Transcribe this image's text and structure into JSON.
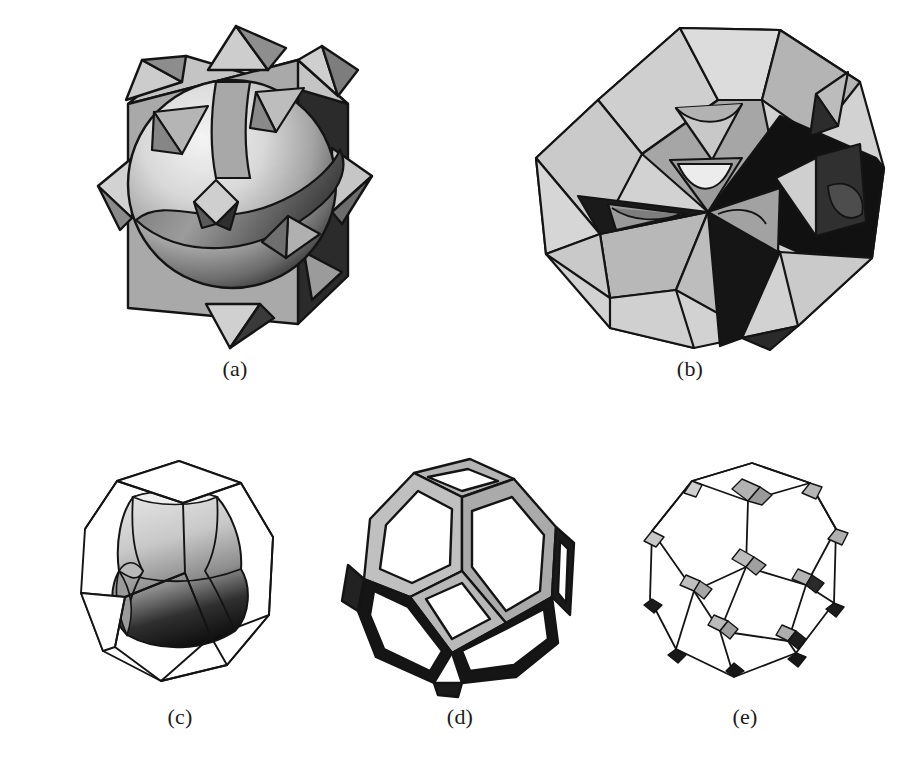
{
  "figure": {
    "domain": "Paper",
    "background_color": "#ffffff",
    "row_layout": [
      2,
      3
    ],
    "palette": {
      "white": "#ffffff",
      "near_white": "#f2f2f2",
      "light_gray": "#d9d9d9",
      "mid_light_gray": "#c2c2c2",
      "mid_gray": "#a8a8a8",
      "dark_gray": "#6b6b6b",
      "very_dark_gray": "#2e2e2e",
      "black": "#111111",
      "outline": "#141414"
    }
  },
  "panels": [
    {
      "id": "a",
      "label": "(a)",
      "caption_label": "(a)",
      "subject": "sphere intersecting a cube with octahedral spikes",
      "shading": "radial gradient sphere, flat shaded cube faces, dark right face",
      "face_tones": {
        "front": "#a8a8a8",
        "top": "#c2c2c2",
        "right_shadow": "#2e2e2e",
        "sphere_highlight": "#f0f0f0",
        "sphere_shadow": "#4a4a4a"
      }
    },
    {
      "id": "b",
      "label": "(b)",
      "caption_label": "(b)",
      "subject": "complex faceted polyhedron with interpenetrating planes and dark interior wedges",
      "shading": "multi-tone flat facets with light, mid and black regions",
      "face_tones": {
        "light": "#d4d4d4",
        "mid": "#a6a6a6",
        "dark": "#111111",
        "accent": "#6b6b6b"
      }
    },
    {
      "id": "c",
      "label": "(c)",
      "caption_label": "(c)",
      "subject": "truncated octahedron wireframe enclosing a shaded curved inner surface",
      "shading": "gradient inner body from light gray top to black bottom, thin black outer wireframe",
      "face_tones": {
        "outer_edge": "#141414",
        "inner_top": "#d0d0d0",
        "inner_bottom": "#111111"
      }
    },
    {
      "id": "d",
      "label": "(d)",
      "caption_label": "(d)",
      "subject": "truncated octahedron open framework with hexagonal and square window openings",
      "shading": "gray rims on upper faces, black rims on lower faces, white openings",
      "face_tones": {
        "upper_rim": "#b5b5b5",
        "lower_rim": "#151515",
        "opening": "#ffffff"
      }
    },
    {
      "id": "e",
      "label": "(e)",
      "caption_label": "(e)",
      "subject": "truncated octahedron thin wireframe with small shaded quadrilateral patches at each vertex",
      "shading": "thin black edges, small gray patches at vertices, black patches on lower silhouette",
      "face_tones": {
        "edge": "#141414",
        "patch_light": "#b0b0b0",
        "patch_dark": "#151515"
      }
    }
  ]
}
